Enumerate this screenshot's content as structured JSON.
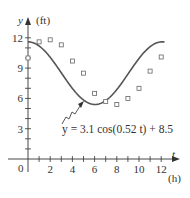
{
  "chart_data": {
    "type": "scatter",
    "title": "",
    "xlabel": "t",
    "xunit": "(h)",
    "ylabel": "y",
    "yunit": "(ft)",
    "xlim": [
      0,
      13
    ],
    "ylim": [
      0,
      12.5
    ],
    "x_ticks": [
      0,
      1,
      2,
      3,
      4,
      5,
      6,
      7,
      8,
      9,
      10,
      11,
      12
    ],
    "x_tick_labels": [
      "0",
      "2",
      "4",
      "6",
      "8",
      "10",
      "12"
    ],
    "x_tick_label_values": [
      0,
      2,
      4,
      6,
      8,
      10,
      12
    ],
    "y_ticks": [
      1,
      2,
      3,
      4,
      5,
      6,
      7,
      8,
      9,
      10,
      11,
      12
    ],
    "y_tick_labels": [
      "3",
      "6",
      "9",
      "12"
    ],
    "y_tick_label_values": [
      3,
      6,
      9,
      12
    ],
    "grid": false,
    "series": [
      {
        "name": "data",
        "type": "scatter",
        "marker": "square",
        "x": [
          0,
          1,
          2,
          3,
          4,
          5,
          6,
          7,
          8,
          9,
          10,
          11,
          12
        ],
        "y": [
          10.0,
          11.6,
          11.8,
          11.3,
          9.7,
          8.5,
          6.5,
          5.7,
          5.4,
          6.0,
          7.0,
          8.7,
          10.1
        ]
      },
      {
        "name": "model",
        "type": "line",
        "equation": "y = 3.1 cos(0.52 t) + 8.5",
        "amplitude": 3.1,
        "frequency": 0.52,
        "offset": 8.5,
        "t_range": [
          0,
          12.3
        ]
      }
    ],
    "annotations": [
      {
        "text": "y = 3.1 cos(0.52 t) + 8.5",
        "points_to_t": 5.2
      }
    ],
    "colors": {
      "curve": "#555555",
      "markers": "#666666",
      "axes": "#333333"
    }
  },
  "labels": {
    "y_axis": "y",
    "y_unit": "(ft)",
    "x_axis": "t",
    "x_unit": "(h)",
    "origin": "0",
    "equation": "y = 3.1 cos(0.52 t) + 8.5"
  }
}
